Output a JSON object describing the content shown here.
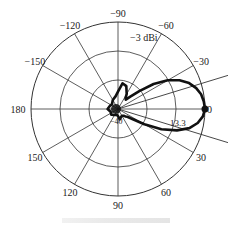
{
  "chart_data": {
    "type": "polar",
    "title": "",
    "unit_label": "−3 dBi",
    "radial_labels": [
      "−40",
      "13.3"
    ],
    "angle_labels": [
      {
        "angle": -90,
        "text": "−90"
      },
      {
        "angle": -120,
        "text": "−120"
      },
      {
        "angle": -60,
        "text": "−60"
      },
      {
        "angle": -150,
        "text": "−150"
      },
      {
        "angle": -30,
        "text": "−30"
      },
      {
        "angle": 180,
        "text": "180"
      },
      {
        "angle": 0,
        "text": "0"
      },
      {
        "angle": 150,
        "text": "150"
      },
      {
        "angle": 30,
        "text": "30"
      },
      {
        "angle": 120,
        "text": "120"
      },
      {
        "angle": 60,
        "text": "60"
      },
      {
        "angle": 90,
        "text": "90"
      }
    ],
    "rings": 3,
    "spokes_deg": [
      0,
      30,
      60,
      90,
      120,
      150,
      180,
      210,
      240,
      270,
      300,
      330
    ],
    "beamwidth_lines_deg": [
      -17,
      17
    ],
    "series": [
      {
        "name": "radiation pattern",
        "angles_deg": [
          0,
          5,
          10,
          15,
          20,
          25,
          30,
          35,
          40,
          45,
          50,
          60,
          70,
          80,
          90,
          100,
          120,
          140,
          160,
          180,
          -160,
          -140,
          -120,
          -100,
          -90,
          -80,
          -70,
          -60,
          -55,
          -50,
          -45,
          -40,
          -35,
          -30,
          -25,
          -20,
          -15,
          -10,
          -5
        ],
        "r_norm": [
          1.0,
          0.98,
          0.93,
          0.85,
          0.72,
          0.55,
          0.35,
          0.2,
          0.14,
          0.12,
          0.1,
          0.09,
          0.1,
          0.12,
          0.08,
          0.07,
          0.08,
          0.1,
          0.09,
          0.12,
          0.1,
          0.09,
          0.12,
          0.15,
          0.2,
          0.3,
          0.28,
          0.2,
          0.15,
          0.14,
          0.2,
          0.32,
          0.5,
          0.66,
          0.78,
          0.87,
          0.93,
          0.97,
          0.99
        ]
      }
    ],
    "max_label": "0"
  },
  "caption": ""
}
